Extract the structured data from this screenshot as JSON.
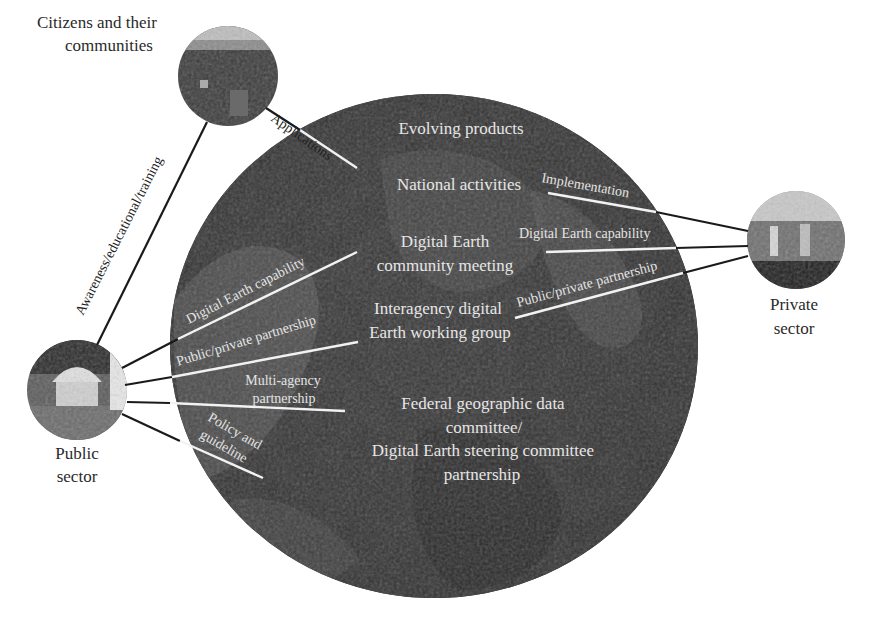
{
  "diagram": {
    "nodes": {
      "citizens": {
        "label_line1": "Citizens and their",
        "label_line2": "communities"
      },
      "private": {
        "label_line1": "Private",
        "label_line2": "sector"
      },
      "public": {
        "label_line1": "Public",
        "label_line2": "sector"
      }
    },
    "globe_labels": {
      "evolving_products": "Evolving products",
      "national_activities": "National activities",
      "community_meeting_line1": "Digital Earth",
      "community_meeting_line2": "community meeting",
      "working_group_line1": "Interagency digital",
      "working_group_line2": "Earth working group",
      "fgdc_line1": "Federal geographic data",
      "fgdc_line2": "committee/",
      "fgdc_line3": "Digital Earth steering committee",
      "fgdc_line4": "partnership"
    },
    "edges": {
      "awareness": "Awareness/educational/training",
      "applications": "Applications",
      "implementation": "Implementation",
      "private_capability": "Digital Earth capability",
      "private_partnership": "Public/private partnership",
      "public_capability": "Digital Earth capability",
      "public_partnership": "Public/private partnership",
      "multi_agency_line1": "Multi-agency",
      "multi_agency_line2": "partnership",
      "policy_line1": "Policy and",
      "policy_line2": "guideline"
    },
    "colors": {
      "background": "#ffffff",
      "globe_dark": "#1c1c1c",
      "globe_mid": "#4a4a4a",
      "line_outside": "#1a1a1a",
      "line_inside": "#f2f2f2"
    }
  }
}
